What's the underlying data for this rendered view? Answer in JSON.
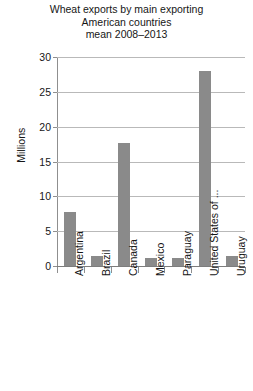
{
  "chart_data": {
    "type": "bar",
    "title": "Wheat exports by main exporting American countries mean 2008–2013",
    "title_lines": [
      "Wheat exports by main exporting",
      "American countries",
      "mean 2008–2013"
    ],
    "categories": [
      "Argentina",
      "Brazil",
      "Canada",
      "Mexico",
      "Paraguay",
      "United States of ...",
      "Uruguay"
    ],
    "values": [
      7.75,
      1.4,
      17.6,
      1.1,
      1.2,
      28.0,
      1.5
    ],
    "xlabel": "",
    "ylabel": "Millions",
    "ylim": [
      0,
      30
    ],
    "ytick_values": [
      0,
      5,
      10,
      15,
      20,
      25,
      30
    ],
    "ytick_labels": [
      "0",
      "5",
      "10",
      "15",
      "20",
      "25",
      "30"
    ],
    "grid": true,
    "legend": false,
    "bar_color": "#8a8a8a",
    "gridline_color": "#b9b9b9",
    "axis_color": "#8f8f8f",
    "background_color": "#ffffff",
    "text_color": "#161616"
  }
}
